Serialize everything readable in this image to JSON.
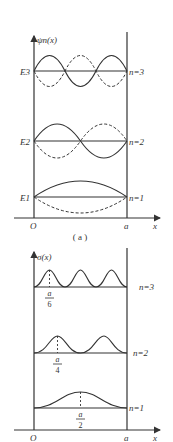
{
  "panel_a": {
    "y_axis_label": "ψn(x)",
    "levels": [
      {
        "energy_label": "E3",
        "n_label": "n=3",
        "n": 3
      },
      {
        "energy_label": "E2",
        "n_label": "n=2",
        "n": 2
      },
      {
        "energy_label": "E1",
        "n_label": "n=1",
        "n": 1
      }
    ],
    "origin_label": "O",
    "wall_label": "a",
    "x_axis_label": "x",
    "caption": "( a )"
  },
  "panel_b": {
    "y_axis_label": "σ(x)",
    "levels": [
      {
        "n_label": "n=3",
        "peak_num": "a",
        "peak_den": "6"
      },
      {
        "n_label": "n=2",
        "peak_num": "a",
        "peak_den": "4"
      },
      {
        "n_label": "n=1",
        "peak_num": "a",
        "peak_den": "2"
      }
    ],
    "origin_label": "O",
    "wall_label": "a",
    "x_axis_label": "x"
  },
  "colors": {
    "line": "#333333",
    "background": "#ffffff"
  }
}
